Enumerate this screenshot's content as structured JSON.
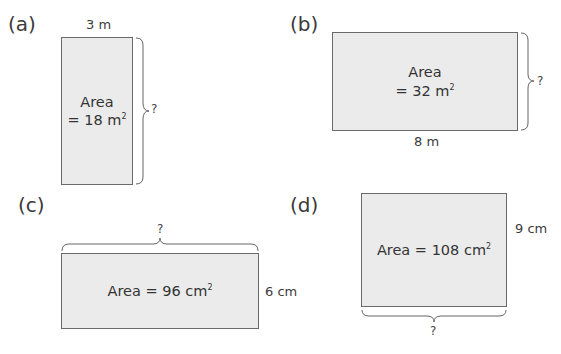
{
  "problems": [
    {
      "label": "(a)",
      "area_line1": "Area",
      "area_line2": "= 18 m",
      "area_unit_power": "2",
      "given_dimension": "3 m",
      "unknown": "?"
    },
    {
      "label": "(b)",
      "area_line1": "Area",
      "area_line2": "= 32 m",
      "area_unit_power": "2",
      "given_dimension": "8 m",
      "unknown": "?"
    },
    {
      "label": "(c)",
      "area_line1": "Area = 96 cm",
      "area_unit_power": "2",
      "given_dimension": "6 cm",
      "unknown": "?"
    },
    {
      "label": "(d)",
      "area_line1": "Area = 108 cm",
      "area_unit_power": "2",
      "given_dimension": "9 cm",
      "unknown": "?"
    }
  ],
  "colors": {
    "fill": "#ebebeb",
    "stroke": "#6a6a6a",
    "text": "#333333"
  }
}
